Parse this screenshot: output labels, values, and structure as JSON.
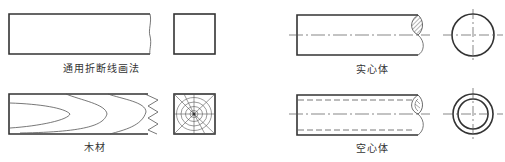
{
  "colors": {
    "line": "#333333",
    "thin": "#555555",
    "background": "#ffffff"
  },
  "panels": [
    {
      "id": "general-break",
      "label": "通用折断线画法",
      "description": "Generic break line: rectangle with wavy right edge plus square end view"
    },
    {
      "id": "wood",
      "label": "木材",
      "description": "Wood: rectangle with grain curves and zigzag break, end view showing growth rings"
    },
    {
      "id": "solid-body",
      "label": "实心体",
      "description": "Solid shaft: rectangle with centerline and hatched S-break, circular end view"
    },
    {
      "id": "hollow-body",
      "label": "空心体",
      "description": "Hollow shaft: rectangle with dashed inner bore lines and S-break, concentric circle end view"
    }
  ]
}
